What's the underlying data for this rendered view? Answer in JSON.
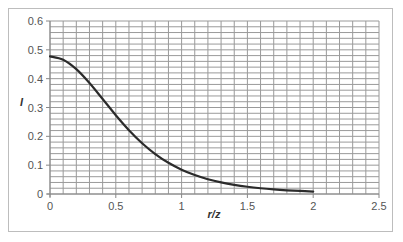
{
  "chart_data": {
    "type": "line",
    "title": "",
    "xlabel": "r/z",
    "ylabel": "I",
    "xlim": [
      0,
      2.5
    ],
    "ylim": [
      0,
      0.6
    ],
    "x_ticks": [
      "0",
      "0.5",
      "1",
      "1.5",
      "2",
      "2.5"
    ],
    "y_ticks": [
      "0",
      "0.1",
      "0.2",
      "0.3",
      "0.4",
      "0.5",
      "0.6"
    ],
    "grid": {
      "on": true,
      "x_minor_step": 0.1,
      "y_minor_step": 0.02
    },
    "legend": null,
    "series": [
      {
        "name": "I",
        "color": "#2b2b2b",
        "x": [
          0,
          0.1,
          0.2,
          0.3,
          0.4,
          0.5,
          0.6,
          0.7,
          0.8,
          0.9,
          1.0,
          1.1,
          1.2,
          1.3,
          1.4,
          1.5,
          1.6,
          1.7,
          1.8,
          1.9,
          2.0
        ],
        "y": [
          0.4775,
          0.4657,
          0.4329,
          0.3849,
          0.3295,
          0.2733,
          0.2214,
          0.1762,
          0.1386,
          0.1083,
          0.0844,
          0.0658,
          0.0513,
          0.0402,
          0.0317,
          0.0251,
          0.02,
          0.016,
          0.0129,
          0.0105,
          0.0085
        ]
      }
    ]
  },
  "colors": {
    "grid": "#9a9a9a",
    "axis": "#888888",
    "line": "#2b2b2b",
    "border": "#bdbdbd"
  }
}
